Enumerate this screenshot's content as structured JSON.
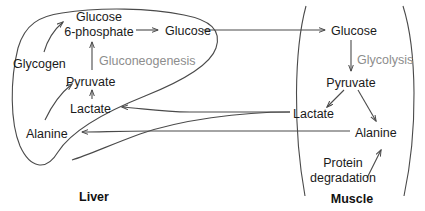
{
  "diagram": {
    "colors": {
      "outline": "#4a4a4a",
      "text": "#1a1a1a",
      "pathway_text": "#8d8d8d",
      "background": "#ffffff"
    },
    "compartments": [
      {
        "id": "liver",
        "label": "Liver"
      },
      {
        "id": "muscle",
        "label": "Muscle"
      }
    ],
    "liver": {
      "name": "Liver",
      "metabolites": [
        {
          "id": "glucose-6-phosphate-line1",
          "label": "Glucose"
        },
        {
          "id": "glucose-6-phosphate-line2",
          "label": "6-phosphate"
        },
        {
          "id": "glucose",
          "label": "Glucose"
        },
        {
          "id": "glycogen",
          "label": "Glycogen"
        },
        {
          "id": "pyruvate",
          "label": "Pyruvate"
        },
        {
          "id": "lactate",
          "label": "Lactate"
        },
        {
          "id": "alanine",
          "label": "Alanine"
        }
      ],
      "pathways": [
        {
          "id": "gluconeogenesis",
          "label": "Gluconeogenesis"
        }
      ]
    },
    "muscle": {
      "name": "Muscle",
      "metabolites": [
        {
          "id": "glucose",
          "label": "Glucose"
        },
        {
          "id": "pyruvate",
          "label": "Pyruvate"
        },
        {
          "id": "lactate",
          "label": "Lactate"
        },
        {
          "id": "alanine",
          "label": "Alanine"
        }
      ],
      "pathways": [
        {
          "id": "glycolysis",
          "label": "Glycolysis"
        },
        {
          "id": "protein-degradation-line1",
          "label": "Protein"
        },
        {
          "id": "protein-degradation-line2",
          "label": "degradation"
        }
      ]
    }
  }
}
